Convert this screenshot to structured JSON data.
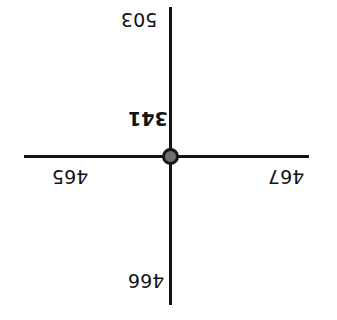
{
  "diagram": {
    "type": "node-cross-diagram",
    "background_color": "#ffffff",
    "line_color": "#141414",
    "node_fill_color": "#6e6e6e",
    "node_border_color": "#141414",
    "text_color": "#141414",
    "center_node": {
      "shape": "filled-circle",
      "label": "341"
    },
    "labels": {
      "top": "503",
      "center": "341",
      "left": "465",
      "right": "467",
      "bottom": "466"
    },
    "orientation_note": "all labels rendered rotated 180 degrees"
  },
  "chart_data": {
    "type": "diagram",
    "title": "",
    "layout": "cross",
    "nodes": [
      {
        "position": "top",
        "value": "503",
        "bold": false
      },
      {
        "position": "center",
        "value": "341",
        "bold": true
      },
      {
        "position": "left",
        "value": "465",
        "bold": false
      },
      {
        "position": "right",
        "value": "467",
        "bold": false
      },
      {
        "position": "bottom",
        "value": "466",
        "bold": false
      }
    ],
    "edges": [
      {
        "from": "center",
        "to": "top"
      },
      {
        "from": "center",
        "to": "bottom"
      },
      {
        "from": "center",
        "to": "left"
      },
      {
        "from": "center",
        "to": "right"
      }
    ]
  }
}
